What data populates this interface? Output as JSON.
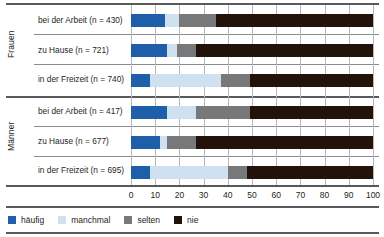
{
  "chart_data": {
    "type": "bar",
    "subtype": "stacked-horizontal-100-percent",
    "title": "",
    "xlabel": "",
    "ylabel": "",
    "xlim": [
      0,
      100
    ],
    "xticks": [
      "0",
      "10",
      "20",
      "30",
      "40",
      "50",
      "60",
      "70",
      "80",
      "90",
      "100"
    ],
    "grid": true,
    "legend_position": "bottom-left",
    "groups": [
      {
        "name": "Frauen",
        "categories": [
          "bei der Arbeit (n = 430)",
          "zu Hause (n = 721)",
          "in der Freizeit (n = 740)"
        ]
      },
      {
        "name": "Männer",
        "categories": [
          "bei der Arbeit (n = 417)",
          "zu Hause (n = 677)",
          "in der Freizeit (n = 695)"
        ]
      }
    ],
    "categories": [
      "bei der Arbeit (n = 430)",
      "zu Hause (n = 721)",
      "in der Freizeit (n = 740)",
      "bei der Arbeit (n = 417)",
      "zu Hause (n = 677)",
      "in der Freizeit (n = 695)"
    ],
    "series": [
      {
        "name": "häufig",
        "color": "#1f5fa9",
        "values": [
          14,
          15,
          8,
          15,
          12,
          8
        ]
      },
      {
        "name": "manchmal",
        "color": "#cfe0f0",
        "values": [
          6,
          4,
          29,
          12,
          3,
          32
        ]
      },
      {
        "name": "selten",
        "color": "#76787a",
        "values": [
          15,
          8,
          12,
          22,
          12,
          8
        ]
      },
      {
        "name": "nie",
        "color": "#231209",
        "values": [
          65,
          73,
          51,
          51,
          73,
          52
        ]
      }
    ]
  },
  "legend": {
    "items": [
      {
        "label": "häufig",
        "color": "#1f5fa9"
      },
      {
        "label": "manchmal",
        "color": "#cfe0f0"
      },
      {
        "label": "selten",
        "color": "#76787a"
      },
      {
        "label": "nie",
        "color": "#231209"
      }
    ]
  },
  "axis": {
    "ticks": [
      "0",
      "10",
      "20",
      "30",
      "40",
      "50",
      "60",
      "70",
      "80",
      "90",
      "100"
    ]
  },
  "rows": [
    {
      "label": "bei der Arbeit (n = 430)",
      "group": "Frauen"
    },
    {
      "label": "zu Hause (n = 721)",
      "group": "Frauen"
    },
    {
      "label": "in der Freizeit (n = 740)",
      "group": "Frauen"
    },
    {
      "label": "bei der Arbeit (n = 417)",
      "group": "Männer"
    },
    {
      "label": "zu Hause (n = 677)",
      "group": "Männer"
    },
    {
      "label": "in der Freizeit (n = 695)",
      "group": "Männer"
    }
  ],
  "groups": [
    {
      "label": "Frauen"
    },
    {
      "label": "Männer"
    }
  ]
}
